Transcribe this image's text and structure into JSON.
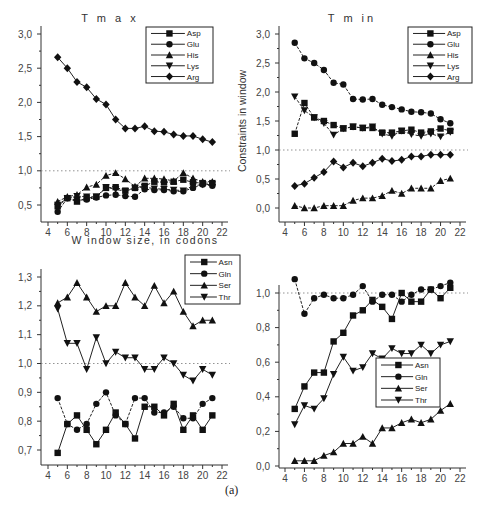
{
  "figure": {
    "caption": "(a)"
  },
  "chart_data": [
    {
      "type": "line",
      "title": "T m a x",
      "xlabel": "W indow size, in codons",
      "ylabel": "",
      "x": [
        5,
        6,
        7,
        8,
        9,
        10,
        11,
        12,
        13,
        14,
        15,
        16,
        17,
        18,
        19,
        20,
        21
      ],
      "xticks": [
        "4",
        "6",
        "8",
        "10",
        "12",
        "14",
        "16",
        "18",
        "20",
        "22"
      ],
      "yticks": [
        "0,5",
        "1,0",
        "1,5",
        "2,0",
        "2,5",
        "3,0"
      ],
      "ylim": [
        0.3,
        3.0
      ],
      "xlim": [
        4,
        22
      ],
      "reference_line": 1.0,
      "legend_position": "top-right",
      "series": [
        {
          "name": "Asp",
          "marker": "square",
          "values": [
            0.48,
            0.6,
            0.55,
            0.6,
            0.62,
            0.75,
            0.76,
            0.71,
            0.75,
            0.78,
            0.84,
            0.83,
            0.84,
            0.87,
            0.83,
            0.82,
            0.82
          ]
        },
        {
          "name": "Glu",
          "marker": "circle",
          "values": [
            0.4,
            0.6,
            0.57,
            0.58,
            0.61,
            0.64,
            0.65,
            0.63,
            0.62,
            0.73,
            0.72,
            0.72,
            0.7,
            0.7,
            0.75,
            0.8,
            0.78
          ]
        },
        {
          "name": "His",
          "marker": "triangle-up",
          "values": [
            0.55,
            0.62,
            0.65,
            0.76,
            0.8,
            0.93,
            0.97,
            0.88,
            0.77,
            0.89,
            0.89,
            0.88,
            0.85,
            0.97,
            0.89,
            0.84,
            0.84
          ]
        },
        {
          "name": "Lys",
          "marker": "triangle-down",
          "values": [
            0.5,
            0.6,
            0.63,
            0.62,
            0.62,
            0.76,
            0.73,
            0.7,
            0.75,
            0.76,
            0.74,
            0.73,
            0.72,
            0.71,
            0.78,
            0.8,
            0.8
          ]
        },
        {
          "name": "Arg",
          "marker": "diamond",
          "values": [
            2.66,
            2.5,
            2.3,
            2.22,
            2.05,
            1.97,
            1.75,
            1.62,
            1.62,
            1.65,
            1.58,
            1.57,
            1.53,
            1.51,
            1.51,
            1.46,
            1.42
          ]
        }
      ]
    },
    {
      "type": "line",
      "title": "T m in",
      "xlabel": "",
      "ylabel": "Constraints in window",
      "x": [
        5,
        6,
        7,
        8,
        9,
        10,
        11,
        12,
        13,
        14,
        15,
        16,
        17,
        18,
        19,
        20,
        21
      ],
      "xticks": [
        "4",
        "6",
        "8",
        "10",
        "12",
        "14",
        "16",
        "18",
        "20",
        "22"
      ],
      "yticks": [
        "0,0",
        "0,5",
        "1,0",
        "1,5",
        "2,0",
        "2,5",
        "3,0"
      ],
      "ylim": [
        -0.2,
        3.0
      ],
      "xlim": [
        4,
        22
      ],
      "reference_line": 1.0,
      "legend_position": "top-right",
      "series": [
        {
          "name": "Asp",
          "marker": "square",
          "values": [
            1.28,
            1.81,
            1.56,
            1.5,
            1.43,
            1.37,
            1.4,
            1.38,
            1.38,
            1.3,
            1.3,
            1.33,
            1.35,
            1.3,
            1.32,
            1.37,
            1.33
          ]
        },
        {
          "name": "Glu",
          "marker": "circle",
          "values": [
            2.85,
            2.58,
            2.5,
            2.38,
            2.16,
            2.13,
            1.88,
            1.87,
            1.88,
            1.78,
            1.74,
            1.7,
            1.66,
            1.65,
            1.63,
            1.53,
            1.46
          ]
        },
        {
          "name": "His",
          "marker": "triangle-up",
          "values": [
            0.04,
            0.0,
            0.0,
            0.04,
            0.04,
            0.04,
            0.13,
            0.17,
            0.17,
            0.21,
            0.3,
            0.25,
            0.34,
            0.34,
            0.34,
            0.47,
            0.51
          ]
        },
        {
          "name": "Lys",
          "marker": "triangle-down",
          "values": [
            1.92,
            1.68,
            1.56,
            1.46,
            1.26,
            1.37,
            1.4,
            1.38,
            1.4,
            1.28,
            1.24,
            1.33,
            1.27,
            1.24,
            1.28,
            1.23,
            1.31
          ]
        },
        {
          "name": "Arg",
          "marker": "diamond",
          "values": [
            0.38,
            0.42,
            0.52,
            0.62,
            0.8,
            0.7,
            0.78,
            0.72,
            0.78,
            0.85,
            0.81,
            0.83,
            0.89,
            0.89,
            0.92,
            0.92,
            0.92
          ]
        }
      ]
    },
    {
      "type": "line",
      "title": "",
      "xlabel": "",
      "ylabel": "",
      "x": [
        5,
        6,
        7,
        8,
        9,
        10,
        11,
        12,
        13,
        14,
        15,
        16,
        17,
        18,
        19,
        20,
        21
      ],
      "xticks": [
        "4",
        "6",
        "8",
        "10",
        "12",
        "14",
        "16",
        "18",
        "20",
        "22"
      ],
      "yticks": [
        "0,7",
        "0,8",
        "0,9",
        "1,0",
        "1,1",
        "1,2",
        "1,3"
      ],
      "ylim": [
        0.65,
        1.3
      ],
      "xlim": [
        4,
        22
      ],
      "reference_line": 1.0,
      "legend_position": "top-right",
      "series": [
        {
          "name": "Asn",
          "marker": "square",
          "values": [
            0.69,
            0.79,
            0.82,
            0.77,
            0.72,
            0.77,
            0.83,
            0.79,
            0.74,
            0.85,
            0.85,
            0.82,
            0.86,
            0.77,
            0.82,
            0.77,
            0.82
          ]
        },
        {
          "name": "Gln",
          "marker": "circle",
          "values": [
            0.88,
            0.79,
            0.77,
            0.79,
            0.86,
            0.9,
            0.82,
            0.79,
            0.88,
            0.88,
            0.83,
            0.83,
            0.85,
            0.81,
            0.81,
            0.86,
            0.88
          ]
        },
        {
          "name": "Ser",
          "marker": "triangle-up",
          "values": [
            1.21,
            1.23,
            1.28,
            1.23,
            1.18,
            1.2,
            1.2,
            1.28,
            1.23,
            1.2,
            1.27,
            1.21,
            1.25,
            1.18,
            1.13,
            1.15,
            1.15
          ]
        },
        {
          "name": "Thr",
          "marker": "triangle-down",
          "values": [
            1.19,
            1.07,
            1.07,
            0.98,
            1.09,
            1.0,
            1.04,
            1.02,
            1.02,
            0.98,
            0.98,
            1.02,
            1.0,
            0.96,
            0.94,
            0.98,
            0.96
          ]
        }
      ]
    },
    {
      "type": "line",
      "title": "",
      "xlabel": "",
      "ylabel": "",
      "x": [
        5,
        6,
        7,
        8,
        9,
        10,
        11,
        12,
        13,
        14,
        15,
        16,
        17,
        18,
        19,
        20,
        21
      ],
      "xticks": [
        "4",
        "6",
        "8",
        "10",
        "12",
        "14",
        "16",
        "18",
        "20",
        "22"
      ],
      "yticks": [
        "0,0",
        "0,2",
        "0,4",
        "0,6",
        "0,8",
        "1,0"
      ],
      "ylim": [
        0.0,
        1.1
      ],
      "xlim": [
        4,
        22
      ],
      "reference_line": 1.0,
      "legend_position": "lower-middle",
      "series": [
        {
          "name": "Asn",
          "marker": "square",
          "values": [
            0.33,
            0.46,
            0.54,
            0.54,
            0.72,
            0.77,
            0.87,
            0.9,
            0.96,
            0.92,
            0.85,
            1.0,
            0.95,
            0.95,
            1.02,
            0.97,
            1.03
          ]
        },
        {
          "name": "Gln",
          "marker": "circle",
          "values": [
            1.08,
            0.88,
            0.97,
            0.99,
            0.97,
            0.97,
            0.99,
            1.04,
            0.95,
            0.99,
            0.99,
            0.95,
            0.99,
            1.02,
            1.02,
            1.04,
            1.06
          ]
        },
        {
          "name": "Ser",
          "marker": "triangle-up",
          "values": [
            0.03,
            0.03,
            0.03,
            0.06,
            0.08,
            0.13,
            0.13,
            0.17,
            0.13,
            0.22,
            0.22,
            0.25,
            0.27,
            0.25,
            0.27,
            0.32,
            0.36
          ]
        },
        {
          "name": "Thr",
          "marker": "triangle-down",
          "values": [
            0.24,
            0.35,
            0.33,
            0.39,
            0.53,
            0.63,
            0.55,
            0.57,
            0.65,
            0.62,
            0.68,
            0.65,
            0.65,
            0.7,
            0.65,
            0.7,
            0.72
          ]
        }
      ]
    }
  ]
}
